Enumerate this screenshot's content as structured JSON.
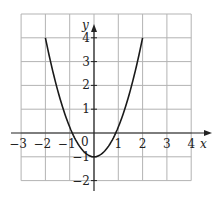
{
  "chart_data": {
    "type": "line",
    "title": "",
    "xlabel": "x",
    "ylabel": "y",
    "xlim": [
      -3,
      4
    ],
    "ylim": [
      -2,
      5
    ],
    "grid": true,
    "x_ticks": [
      -3,
      -2,
      -1,
      1,
      2,
      3,
      4
    ],
    "x_tick_labels": [
      "−3",
      "−2",
      "−1",
      "1",
      "2",
      "3",
      "4"
    ],
    "y_ticks": [
      -2,
      -1,
      1,
      2,
      3,
      4
    ],
    "y_tick_labels": [
      "−2",
      "−1",
      "1",
      "2",
      "3",
      "4"
    ],
    "origin_label": "0",
    "series": [
      {
        "name": "parabola",
        "domain": [
          -2,
          2
        ],
        "x": [
          -2,
          -1.5,
          -1,
          -0.894,
          -0.5,
          0,
          0.5,
          0.894,
          1,
          1.5,
          2
        ],
        "y": [
          4,
          1.81,
          0.25,
          0,
          -0.69,
          -1,
          -0.69,
          0,
          0.25,
          1.81,
          4
        ]
      }
    ],
    "colors": {
      "grid": "#b3b3b3",
      "axis": "#222222",
      "curve": "#1a1a1a"
    }
  },
  "labels": {
    "x_axis": "x",
    "y_axis": "y",
    "origin": "0"
  }
}
